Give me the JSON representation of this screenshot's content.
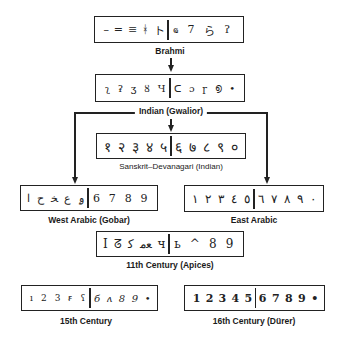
{
  "nodes": {
    "brahmi": {
      "label": "Brahmi",
      "left_glyphs": [
        "–",
        "=",
        "≡",
        "ᚼ",
        "ト"
      ],
      "right_glyphs": [
        "ҩ",
        "7",
        "ら",
        "ʔ"
      ]
    },
    "indian_gwalior": {
      "label": "Indian (Gwalior)",
      "left_glyphs": [
        "ʅ",
        "ʡ",
        "ʒ",
        "ȣ",
        "Ч"
      ],
      "right_glyphs": [
        "ᑕ",
        "ɔ",
        "ɼ",
        "൭",
        "•"
      ]
    },
    "sanskrit_devanagari": {
      "label": "Sanskrit–Devanagari (Indian)",
      "left_glyphs": [
        "१",
        "२",
        "३",
        "४",
        "५"
      ],
      "right_glyphs": [
        "६",
        "७",
        "८",
        "९",
        "०"
      ]
    },
    "west_arabic": {
      "label": "West Arabic (Gobar)",
      "left_glyphs": [
        "ا",
        "ح",
        "ﺨ",
        "ع",
        "ۄ"
      ],
      "right_glyphs": [
        "6",
        "7",
        "8",
        "9"
      ]
    },
    "east_arabic": {
      "label": "East Arabic",
      "left_glyphs": [
        "١",
        "٢",
        "٣",
        "٤",
        "٥"
      ],
      "right_glyphs": [
        "٦",
        "٧",
        "٨",
        "٩",
        "٠"
      ]
    },
    "eleventh_century": {
      "label": "11th Century (Apices)",
      "left_glyphs": [
        "I",
        "ᘔ",
        "ﻛ",
        "ﻌﻣ",
        "ч"
      ],
      "right_glyphs": [
        "ь",
        "^",
        "8",
        "9"
      ]
    },
    "fifteenth_century": {
      "label": "15th Century",
      "left_glyphs": [
        "ı",
        "2",
        "3",
        "ꞧ",
        "ʕ"
      ],
      "right_glyphs": [
        "б",
        "ʌ",
        "8",
        "9",
        "•"
      ]
    },
    "sixteenth_century": {
      "label": "16th Century (Dürer)",
      "left_glyphs": [
        "1",
        "2",
        "3",
        "4",
        "5"
      ],
      "right_glyphs": [
        "6",
        "7",
        "8",
        "9",
        "•"
      ]
    }
  },
  "edges": [
    {
      "from": "Brahmi",
      "to": "Indian (Gwalior)"
    },
    {
      "from": "Indian (Gwalior)",
      "to": "Sanskrit–Devanagari (Indian)"
    },
    {
      "from": "Indian (Gwalior)",
      "to": "West Arabic (Gobar)"
    },
    {
      "from": "Indian (Gwalior)",
      "to": "East Arabic"
    }
  ]
}
